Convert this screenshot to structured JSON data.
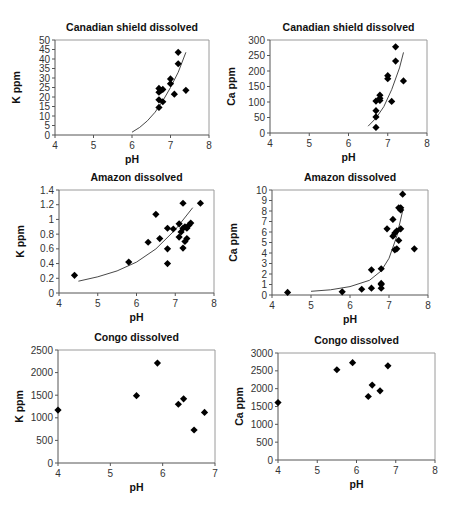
{
  "chart_data": [
    {
      "id": "k-canadian",
      "type": "scatter",
      "title": "Canadian shield dissolved",
      "xlabel": "pH",
      "ylabel": "K ppm",
      "xlim": [
        4,
        8
      ],
      "ylim": [
        0,
        50
      ],
      "xticks": [
        4,
        5,
        6,
        7,
        8
      ],
      "yticks": [
        0,
        5,
        10,
        15,
        20,
        25,
        30,
        35,
        40,
        45,
        50
      ],
      "grid": false,
      "legend": "none",
      "marker": "diamond",
      "points": [
        [
          6.7,
          14.5
        ],
        [
          6.7,
          18.5
        ],
        [
          6.7,
          22.5
        ],
        [
          6.7,
          24.5
        ],
        [
          6.75,
          23.5
        ],
        [
          6.8,
          24
        ],
        [
          6.8,
          17.5
        ],
        [
          7.0,
          29.5
        ],
        [
          7.0,
          27
        ],
        [
          7.1,
          21.5
        ],
        [
          7.2,
          43.5
        ],
        [
          7.2,
          37.5
        ],
        [
          7.4,
          23.5
        ]
      ],
      "trendline": {
        "type": "exponential",
        "x": [
          6.0,
          7.4
        ],
        "points": [
          [
            6.0,
            1.5
          ],
          [
            6.2,
            4
          ],
          [
            6.4,
            7.5
          ],
          [
            6.6,
            12
          ],
          [
            6.8,
            18
          ],
          [
            7.0,
            25
          ],
          [
            7.2,
            33
          ],
          [
            7.4,
            43.5
          ]
        ]
      },
      "frame": {
        "x0": 55,
        "x1": 209,
        "y0": 40,
        "y1": 135
      }
    },
    {
      "id": "ca-canadian",
      "type": "scatter",
      "title": "Canadian shield dissolved",
      "xlabel": "pH",
      "ylabel": "Ca ppm",
      "xlim": [
        4,
        8
      ],
      "ylim": [
        0,
        300
      ],
      "xticks": [
        4,
        5,
        6,
        7,
        8
      ],
      "yticks": [
        0,
        50,
        100,
        150,
        200,
        250,
        300
      ],
      "grid": false,
      "legend": "none",
      "marker": "diamond",
      "points": [
        [
          6.7,
          18
        ],
        [
          6.7,
          52
        ],
        [
          6.7,
          72
        ],
        [
          6.7,
          103
        ],
        [
          6.8,
          105
        ],
        [
          6.8,
          112
        ],
        [
          6.8,
          122
        ],
        [
          7.0,
          175
        ],
        [
          7.0,
          185
        ],
        [
          7.1,
          102
        ],
        [
          7.2,
          232
        ],
        [
          7.2,
          278
        ],
        [
          7.4,
          168
        ]
      ],
      "trendline": {
        "type": "exponential",
        "x": [
          6.5,
          7.4
        ],
        "points": [
          [
            6.5,
            22
          ],
          [
            6.7,
            48
          ],
          [
            6.9,
            85
          ],
          [
            7.1,
            140
          ],
          [
            7.3,
            210
          ],
          [
            7.4,
            260
          ]
        ]
      },
      "frame": {
        "x0": 270,
        "x1": 427,
        "y0": 40,
        "y1": 133
      }
    },
    {
      "id": "k-amazon",
      "type": "scatter",
      "title": "Amazon dissolved",
      "xlabel": "pH",
      "ylabel": "K ppm",
      "xlim": [
        4,
        8
      ],
      "ylim": [
        0,
        1.4
      ],
      "xticks": [
        4,
        5,
        6,
        7,
        8
      ],
      "yticks": [
        0,
        0.2,
        0.4,
        0.6,
        0.8,
        1,
        1.2,
        1.4
      ],
      "ytick_labels": [
        "0",
        "0.2",
        "0.4",
        "0.6",
        "0.8",
        "1",
        "1.2",
        "1.4"
      ],
      "grid": false,
      "legend": "none",
      "marker": "diamond",
      "points": [
        [
          4.4,
          0.24
        ],
        [
          5.8,
          0.42
        ],
        [
          6.3,
          0.69
        ],
        [
          6.5,
          1.07
        ],
        [
          6.6,
          0.74
        ],
        [
          6.8,
          0.88
        ],
        [
          6.8,
          0.6
        ],
        [
          6.8,
          0.4
        ],
        [
          6.95,
          0.87
        ],
        [
          7.1,
          0.94
        ],
        [
          7.1,
          0.76
        ],
        [
          7.15,
          0.83
        ],
        [
          7.2,
          0.61
        ],
        [
          7.2,
          0.88
        ],
        [
          7.2,
          1.22
        ],
        [
          7.25,
          0.9
        ],
        [
          7.25,
          0.7
        ],
        [
          7.3,
          0.74
        ],
        [
          7.3,
          0.88
        ],
        [
          7.35,
          0.92
        ],
        [
          7.4,
          0.95
        ],
        [
          7.65,
          1.22
        ]
      ],
      "trendline": {
        "type": "exponential",
        "x": [
          4.5,
          7.45
        ],
        "points": [
          [
            4.5,
            0.16
          ],
          [
            5.0,
            0.22
          ],
          [
            5.5,
            0.3
          ],
          [
            6.0,
            0.42
          ],
          [
            6.5,
            0.6
          ],
          [
            7.0,
            0.86
          ],
          [
            7.45,
            1.16
          ]
        ]
      },
      "frame": {
        "x0": 59,
        "x1": 214,
        "y0": 190,
        "y1": 293
      }
    },
    {
      "id": "ca-amazon",
      "type": "scatter",
      "title": "Amazon dissolved",
      "xlabel": "pH",
      "ylabel": "Ca ppm",
      "xlim": [
        4,
        8
      ],
      "ylim": [
        0,
        10
      ],
      "xticks": [
        4,
        5,
        6,
        7,
        8
      ],
      "yticks": [
        0,
        1,
        2,
        3,
        4,
        5,
        6,
        7,
        8,
        9,
        10
      ],
      "grid": false,
      "legend": "none",
      "marker": "diamond",
      "points": [
        [
          4.4,
          0.25
        ],
        [
          5.8,
          0.3
        ],
        [
          6.3,
          0.55
        ],
        [
          6.55,
          0.65
        ],
        [
          6.55,
          2.4
        ],
        [
          6.8,
          0.65
        ],
        [
          6.8,
          1.0
        ],
        [
          6.8,
          1.1
        ],
        [
          6.8,
          2.5
        ],
        [
          6.95,
          6.3
        ],
        [
          7.1,
          7.2
        ],
        [
          7.1,
          5.6
        ],
        [
          7.15,
          4.3
        ],
        [
          7.15,
          5.9
        ],
        [
          7.2,
          4.4
        ],
        [
          7.2,
          6.1
        ],
        [
          7.25,
          8.3
        ],
        [
          7.25,
          5.2
        ],
        [
          7.3,
          8.1
        ],
        [
          7.3,
          8.3
        ],
        [
          7.3,
          6.3
        ],
        [
          7.35,
          9.6
        ],
        [
          7.65,
          4.4
        ]
      ],
      "trendline": {
        "type": "exponential",
        "x": [
          5.0,
          7.35
        ],
        "points": [
          [
            5.0,
            0.35
          ],
          [
            5.5,
            0.5
          ],
          [
            6.0,
            0.8
          ],
          [
            6.5,
            1.4
          ],
          [
            6.8,
            2.3
          ],
          [
            7.0,
            3.5
          ],
          [
            7.2,
            5.6
          ],
          [
            7.35,
            8.0
          ]
        ]
      },
      "frame": {
        "x0": 272,
        "x1": 428,
        "y0": 190,
        "y1": 295
      }
    },
    {
      "id": "k-congo",
      "type": "scatter",
      "title": "Congo dissolved",
      "xlabel": "pH",
      "ylabel": "K ppm",
      "xlim": [
        4,
        7
      ],
      "ylim": [
        0,
        2500
      ],
      "xticks": [
        4,
        5,
        6,
        7
      ],
      "yticks": [
        0,
        500,
        1000,
        1500,
        2000,
        2500
      ],
      "grid": false,
      "legend": "none",
      "marker": "diamond",
      "points": [
        [
          4.0,
          1170
        ],
        [
          5.5,
          1490
        ],
        [
          5.9,
          2210
        ],
        [
          6.3,
          1300
        ],
        [
          6.4,
          1420
        ],
        [
          6.6,
          730
        ],
        [
          6.8,
          1120
        ]
      ],
      "trendline": null,
      "frame": {
        "x0": 58,
        "x1": 215,
        "y0": 350,
        "y1": 463
      }
    },
    {
      "id": "ca-congo",
      "type": "scatter",
      "title": "Congo dissolved",
      "xlabel": "pH",
      "ylabel": "Ca ppm",
      "xlim": [
        4,
        8
      ],
      "ylim": [
        0,
        3000
      ],
      "xticks": [
        4,
        5,
        6,
        7,
        8
      ],
      "yticks": [
        0,
        500,
        1000,
        1500,
        2000,
        2500,
        3000
      ],
      "grid": false,
      "legend": "none",
      "marker": "diamond",
      "points": [
        [
          4.0,
          1610
        ],
        [
          5.5,
          2530
        ],
        [
          5.9,
          2730
        ],
        [
          6.3,
          1780
        ],
        [
          6.4,
          2100
        ],
        [
          6.6,
          1940
        ],
        [
          6.8,
          2640
        ]
      ],
      "trendline": null,
      "frame": {
        "x0": 278,
        "x1": 435,
        "y0": 353,
        "y1": 460
      }
    }
  ]
}
